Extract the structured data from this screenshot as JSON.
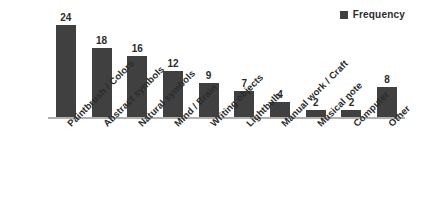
{
  "legend": {
    "position": "top-right",
    "entries": [
      {
        "label": "Frequency",
        "color": "#404040",
        "marker": "square-marker-icon"
      }
    ]
  },
  "axis": {
    "baseline_color": "#b0b0b0"
  },
  "chart_data": {
    "type": "bar",
    "title": "",
    "subtitle": "",
    "xlabel": "",
    "ylabel": "",
    "ylim": [
      0,
      26
    ],
    "grid": false,
    "legend_position": "top-right",
    "bar_color": "#404040",
    "value_labels": true,
    "categories": [
      "Paintbrush / Colors",
      "Abstract symbols",
      "Natural symbols",
      "Mind / Brain",
      "Writing objects",
      "Lightbulb",
      "Manual work / Craft",
      "Musical note",
      "Computer",
      "Other"
    ],
    "series": [
      {
        "name": "Frequency",
        "color": "#404040",
        "values": [
          24,
          18,
          16,
          12,
          9,
          7,
          4,
          2,
          2,
          8
        ]
      }
    ]
  }
}
